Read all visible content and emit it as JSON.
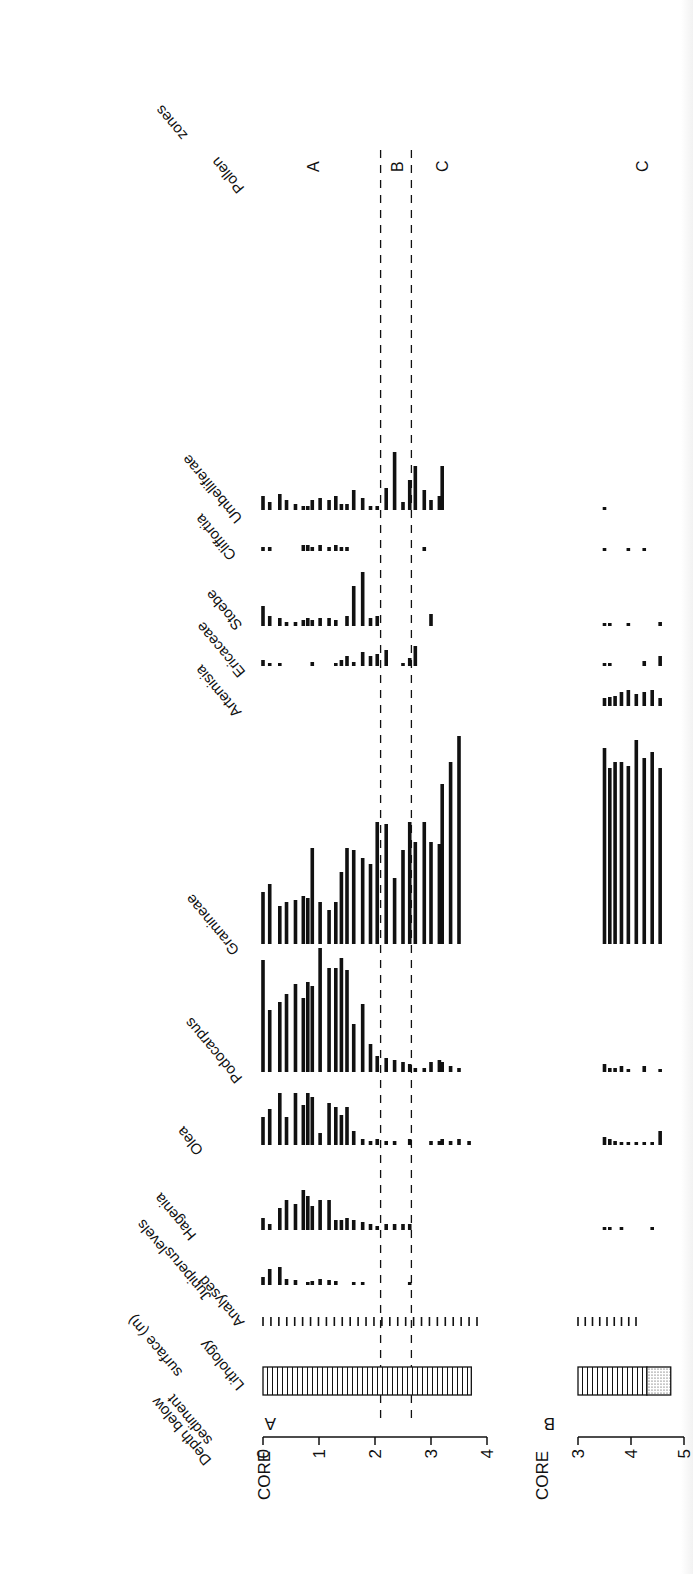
{
  "chart_data": {
    "type": "bar",
    "orientation_note": "Depth runs left-to-right along the page; each taxon curve is a row of vertical bars rising from its baseline.",
    "depth_axis": {
      "label": "Depth below sediment surface (m)",
      "core_a": {
        "label": "CORE A",
        "ticks": [
          0,
          1,
          2,
          3,
          4
        ],
        "range": [
          0,
          4
        ]
      },
      "core_b": {
        "label": "CORE B",
        "ticks": [
          3,
          4,
          5
        ],
        "range": [
          3,
          5
        ]
      }
    },
    "zone_boundaries_m": [
      2.1,
      2.65
    ],
    "pollen_zones": {
      "label": "Pollen zones",
      "core_a": [
        {
          "zone": "A",
          "center_m": 0.9
        },
        {
          "zone": "B",
          "center_m": 2.4
        },
        {
          "zone": "C",
          "center_m": 3.2
        }
      ],
      "core_b": [
        {
          "zone": "C",
          "center_m": 4.2
        }
      ]
    },
    "columns": [
      "Lithology",
      "Analysed levels",
      "Juniperus",
      "Hagenia",
      "Olea",
      "Podocarpus",
      "Gramineae",
      "Artemisia",
      "Ericaceae",
      "Stoebe",
      "Cliffortia",
      "Umbelliferae"
    ],
    "core_a_depths_m": [
      0.0,
      0.12,
      0.3,
      0.42,
      0.58,
      0.72,
      0.8,
      0.88,
      1.02,
      1.18,
      1.3,
      1.4,
      1.5,
      1.62,
      1.78,
      1.92,
      2.04,
      2.2,
      2.35,
      2.5,
      2.62,
      2.72,
      2.88,
      3.0,
      3.15,
      3.2,
      3.35,
      3.5,
      3.68
    ],
    "series_core_a": [
      {
        "name": "Juniperus",
        "values": [
          8,
          16,
          18,
          6,
          5,
          0,
          3,
          4,
          6,
          5,
          4,
          0,
          0,
          2,
          2,
          0,
          0,
          0,
          0,
          0,
          3,
          0,
          0,
          0,
          0,
          0,
          0,
          0,
          0
        ]
      },
      {
        "name": "Hagenia",
        "values": [
          12,
          6,
          22,
          30,
          26,
          40,
          34,
          24,
          30,
          30,
          10,
          10,
          12,
          10,
          8,
          6,
          4,
          6,
          6,
          6,
          6,
          0,
          0,
          0,
          0,
          0,
          0,
          0,
          0
        ]
      },
      {
        "name": "Olea",
        "values": [
          28,
          36,
          52,
          28,
          52,
          40,
          52,
          48,
          12,
          42,
          38,
          30,
          38,
          14,
          6,
          4,
          6,
          4,
          4,
          0,
          6,
          0,
          0,
          4,
          4,
          6,
          4,
          6,
          4
        ]
      },
      {
        "name": "Podocarpus",
        "values": [
          112,
          62,
          70,
          78,
          88,
          74,
          90,
          86,
          124,
          104,
          104,
          114,
          102,
          48,
          68,
          28,
          16,
          14,
          12,
          10,
          8,
          4,
          4,
          10,
          12,
          10,
          6,
          4,
          0
        ]
      },
      {
        "name": "Gramineae",
        "values": [
          52,
          60,
          38,
          42,
          44,
          48,
          46,
          96,
          42,
          34,
          42,
          72,
          96,
          94,
          86,
          80,
          122,
          120,
          66,
          94,
          122,
          102,
          122,
          102,
          100,
          160,
          182,
          208,
          0
        ]
      },
      {
        "name": "Artemisia",
        "values": [
          0,
          0,
          0,
          0,
          0,
          0,
          0,
          0,
          0,
          0,
          0,
          0,
          0,
          0,
          0,
          0,
          0,
          0,
          0,
          0,
          0,
          0,
          0,
          0,
          0,
          0,
          0,
          0,
          0
        ]
      },
      {
        "name": "Ericaceae",
        "values": [
          6,
          2,
          2,
          0,
          0,
          0,
          0,
          4,
          0,
          0,
          2,
          6,
          10,
          4,
          14,
          10,
          12,
          16,
          0,
          2,
          8,
          20,
          0,
          0,
          0,
          0,
          0,
          0,
          0
        ]
      },
      {
        "name": "Stoebe",
        "values": [
          20,
          10,
          8,
          4,
          4,
          6,
          8,
          6,
          8,
          8,
          6,
          0,
          10,
          40,
          54,
          8,
          10,
          0,
          0,
          0,
          0,
          0,
          0,
          12,
          0,
          0,
          0,
          0,
          0
        ]
      },
      {
        "name": "Cliffortia",
        "values": [
          4,
          4,
          0,
          0,
          0,
          6,
          6,
          4,
          6,
          4,
          6,
          4,
          4,
          0,
          0,
          0,
          0,
          0,
          0,
          0,
          0,
          0,
          4,
          0,
          0,
          0,
          0,
          0,
          0
        ]
      },
      {
        "name": "Umbelliferae",
        "values": [
          14,
          8,
          16,
          10,
          6,
          4,
          4,
          10,
          12,
          10,
          14,
          6,
          6,
          20,
          12,
          4,
          4,
          22,
          58,
          8,
          30,
          44,
          20,
          10,
          14,
          44,
          0,
          0,
          0
        ]
      }
    ],
    "core_b_depths_m": [
      3.5,
      3.6,
      3.7,
      3.82,
      3.95,
      4.1,
      4.25,
      4.4,
      4.55
    ],
    "series_core_b": [
      {
        "name": "Podocarpus",
        "values": [
          8,
          4,
          4,
          6,
          2,
          0,
          6,
          0,
          3
        ]
      },
      {
        "name": "Olea",
        "values": [
          8,
          6,
          4,
          3,
          3,
          3,
          3,
          3,
          14
        ]
      },
      {
        "name": "Gramineae",
        "values": [
          196,
          176,
          182,
          182,
          178,
          204,
          186,
          192,
          176
        ]
      },
      {
        "name": "Artemisia",
        "values": [
          8,
          9,
          10,
          14,
          16,
          12,
          14,
          16,
          8
        ]
      },
      {
        "name": "Ericaceae",
        "values": [
          3,
          3,
          0,
          0,
          0,
          0,
          5,
          0,
          10
        ]
      },
      {
        "name": "Stoebe",
        "values": [
          3,
          3,
          0,
          0,
          3,
          0,
          0,
          0,
          4
        ]
      },
      {
        "name": "Cliffortia",
        "values": [
          2,
          0,
          0,
          0,
          2,
          0,
          2,
          0,
          0
        ]
      },
      {
        "name": "Umbelliferae",
        "values": [
          2,
          0,
          0,
          0,
          0,
          0,
          0,
          0,
          0
        ]
      },
      {
        "name": "Hagenia",
        "values": [
          3,
          3,
          0,
          3,
          0,
          0,
          0,
          3,
          0
        ]
      }
    ],
    "lithology": {
      "core_a": [
        {
          "from_m": 0,
          "to_m": 3.72,
          "pattern": "vertical-hatch"
        }
      ],
      "core_b": [
        {
          "from_m": 3.0,
          "to_m": 4.3,
          "pattern": "vertical-hatch"
        },
        {
          "from_m": 4.3,
          "to_m": 4.75,
          "pattern": "stipple"
        }
      ]
    },
    "analysed_levels": {
      "core_a_count": 28,
      "core_b_count": 9
    },
    "grid": false,
    "legend": null
  },
  "labels": {
    "depth": [
      "Depth below",
      "sediment",
      "surface (m)"
    ],
    "lithology": "Lithology",
    "analysed": [
      "Analysed",
      "levels"
    ],
    "pollen_zones": [
      "Pollen",
      "zones"
    ],
    "core_a": "CORE",
    "core_a_letter": "A",
    "core_b": "CORE",
    "core_b_letter": "B",
    "taxa": {
      "Juniperus": "Juniperus",
      "Hagenia": "Hagenia",
      "Olea": "Olea",
      "Podocarpus": "Podocarpus",
      "Gramineae": "Gramineae",
      "Artemisia": "Artemisia",
      "Ericaceae": "Ericaceae",
      "Stoebe": "Stoebe",
      "Cliffortia": "Cliffortia",
      "Umbelliferae": "Umbelliferae"
    }
  }
}
